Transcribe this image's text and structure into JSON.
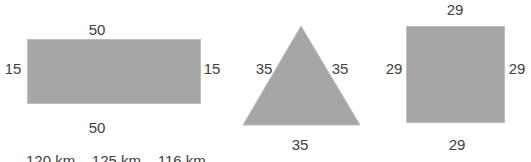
{
  "diagram": {
    "shapes": [
      {
        "type": "rectangle",
        "labels": {
          "top": "50",
          "bottom": "50",
          "left": "15",
          "right": "15"
        }
      },
      {
        "type": "triangle",
        "labels": {
          "left": "35",
          "right": "35",
          "bottom": "35"
        }
      },
      {
        "type": "square",
        "labels": {
          "top": "29",
          "bottom": "29",
          "left": "29",
          "right": "29"
        }
      }
    ],
    "fill_color": "#a6a6a6",
    "clipped_bottom_text": "120 km    125 km    116 km"
  }
}
